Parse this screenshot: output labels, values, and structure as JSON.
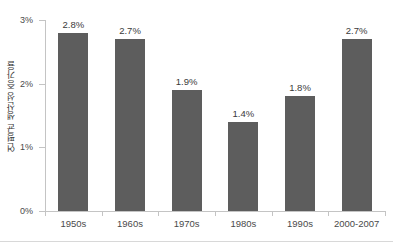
{
  "chart_data": {
    "type": "bar",
    "title": "",
    "subtitle": "",
    "xlabel": "",
    "ylabel": "연평균 생산성 증가율",
    "categories": [
      "1950s",
      "1960s",
      "1970s",
      "1980s",
      "1990s",
      "2000-2007"
    ],
    "values": [
      2.8,
      2.7,
      1.9,
      1.4,
      1.8,
      2.7
    ],
    "value_labels": [
      "2.8%",
      "2.7%",
      "1.9%",
      "1.4%",
      "1.8%",
      "2.7%"
    ],
    "ylim": [
      0,
      3
    ],
    "y_ticks": [
      0,
      1,
      2,
      3
    ],
    "y_tick_labels": [
      "0%",
      "1%",
      "2%",
      "3%"
    ],
    "grid": false,
    "legend": null,
    "legend_position": "none",
    "series": [
      {
        "name": "연평균 생산성 증가율",
        "values": [
          2.8,
          2.7,
          1.9,
          1.4,
          1.8,
          2.7
        ]
      }
    ]
  },
  "style": {
    "bar_color": "#5d5d5d",
    "axis_color": "#c4c4c4",
    "text_color": "#3a3a3a",
    "tick_text_color": "#4a4a4a",
    "background_color": "#ffffff"
  }
}
